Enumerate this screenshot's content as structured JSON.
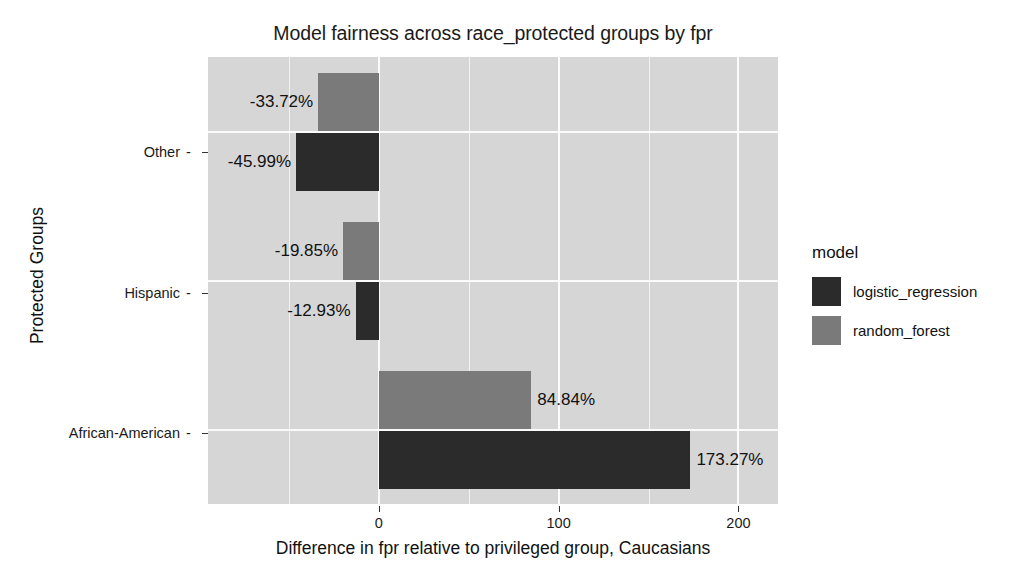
{
  "chart_data": {
    "type": "bar",
    "orientation": "horizontal",
    "title": "Model fairness across race_protected groups by fpr",
    "xlabel": "Difference in fpr relative to privileged group, Caucasians",
    "ylabel": "Protected Groups",
    "categories": [
      "Other",
      "Hispanic",
      "African-American"
    ],
    "series": [
      {
        "name": "logistic_regression",
        "color": "#2b2b2b",
        "values": [
          -45.99,
          -12.93,
          173.27
        ],
        "labels": [
          "-45.99%",
          "-12.93%",
          "173.27%"
        ]
      },
      {
        "name": "random_forest",
        "color": "#7a7a7a",
        "values": [
          -33.72,
          -19.85,
          84.84
        ],
        "labels": [
          "-33.72%",
          "-19.85%",
          "84.84%"
        ]
      }
    ],
    "xticks": [
      0,
      100,
      200
    ],
    "xtick_labels": [
      "0",
      "100",
      "200"
    ],
    "xlim": [
      -95,
      222
    ],
    "grid": true,
    "gridline_step": 50,
    "legend": {
      "title": "model",
      "position": "right",
      "entries": [
        {
          "label": "logistic_regression",
          "color": "#2b2b2b"
        },
        {
          "label": "random_forest",
          "color": "#7a7a7a"
        }
      ]
    },
    "plot_background": "#d6d6d6",
    "figure_background": "#ffffff"
  }
}
